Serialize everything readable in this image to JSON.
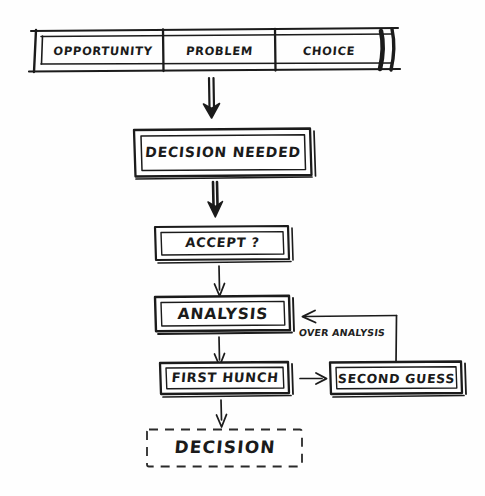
{
  "diagram": {
    "style": "hand-drawn sketch",
    "ink_color": "#1b1b1b",
    "background_color": "#fefefe",
    "top_bar": {
      "name": "inputs-bar",
      "segments": [
        {
          "label": "OPPORTUNITY"
        },
        {
          "label": "PROBLEM"
        },
        {
          "label": "CHOICE"
        }
      ]
    },
    "nodes": [
      {
        "id": "decision-needed",
        "label": "DECISION NEEDED",
        "border": "solid"
      },
      {
        "id": "accept",
        "label": "ACCEPT ?",
        "border": "solid"
      },
      {
        "id": "analysis",
        "label": "ANALYSIS",
        "border": "solid"
      },
      {
        "id": "first-hunch",
        "label": "FIRST HUNCH",
        "border": "solid"
      },
      {
        "id": "second-guess",
        "label": "SECOND GUESS",
        "border": "solid"
      },
      {
        "id": "decision",
        "label": "DECISION",
        "border": "dashed"
      }
    ],
    "edges": [
      {
        "from": "inputs-bar",
        "to": "decision-needed",
        "label": "",
        "weight": "thick"
      },
      {
        "from": "decision-needed",
        "to": "accept",
        "label": "",
        "weight": "thick"
      },
      {
        "from": "accept",
        "to": "analysis",
        "label": "",
        "weight": "thin"
      },
      {
        "from": "analysis",
        "to": "first-hunch",
        "label": "",
        "weight": "thin"
      },
      {
        "from": "first-hunch",
        "to": "second-guess",
        "label": "",
        "weight": "thin"
      },
      {
        "from": "second-guess",
        "to": "analysis",
        "label": "OVER ANALYSIS",
        "weight": "thin"
      },
      {
        "from": "first-hunch",
        "to": "decision",
        "label": "",
        "weight": "thin"
      }
    ]
  }
}
